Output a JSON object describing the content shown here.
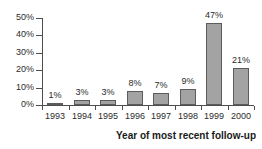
{
  "chart_data": {
    "type": "bar",
    "title": "",
    "subtitle": "",
    "xlabel": "Year of most recent follow-up",
    "ylabel": "",
    "categories": [
      "1993",
      "1994",
      "1995",
      "1996",
      "1997",
      "1998",
      "1999",
      "2000"
    ],
    "values": [
      1,
      3,
      3,
      8,
      7,
      9,
      47,
      21
    ],
    "data_labels": [
      "1%",
      "3%",
      "3%",
      "8%",
      "7%",
      "9%",
      "47%",
      "21%"
    ],
    "ylim": [
      0,
      50
    ],
    "ytick_values": [
      0,
      10,
      20,
      30,
      40,
      50
    ],
    "ytick_labels": [
      "0%",
      "10%",
      "20%",
      "30%",
      "40%",
      "50%"
    ],
    "grid": false,
    "legend": null,
    "bar_fill_color": "#a3a3a3",
    "bar_border_color": "#5c5c5c",
    "axis_color": "#4d4d4d",
    "text_color": "#2b2b2b",
    "background_color": "#ffffff"
  }
}
